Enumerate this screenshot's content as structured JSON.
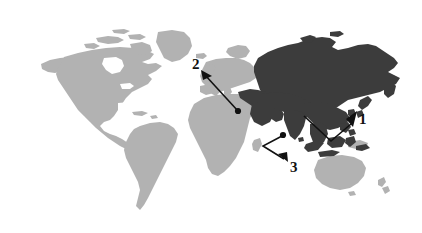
{
  "figure": {
    "type": "map-diagram",
    "title": "",
    "background_color": "#ffffff",
    "width": 422,
    "height": 233
  },
  "colors": {
    "background": "#ffffff",
    "highlighted_region": "#3c3c3c",
    "other_landmass": "#b2b2b2",
    "leader_line": "#111111",
    "label_text": "#111111"
  },
  "map": {
    "projection_note": "equirectangular world map",
    "highlighted_region_name": "Asia",
    "highlighted_fill": "#3c3c3c",
    "unhighlighted_fill": "#b2b2b2",
    "landmasses": [
      {
        "name": "north-america",
        "highlighted": false
      },
      {
        "name": "greenland",
        "highlighted": false
      },
      {
        "name": "south-america",
        "highlighted": false
      },
      {
        "name": "europe",
        "highlighted": false
      },
      {
        "name": "africa",
        "highlighted": false
      },
      {
        "name": "asia",
        "highlighted": true
      },
      {
        "name": "australia",
        "highlighted": false
      },
      {
        "name": "new-zealand",
        "highlighted": false
      }
    ]
  },
  "callouts": [
    {
      "id": "1",
      "label": "1",
      "label_x": 359,
      "label_y": 112,
      "arrow_tip_x": 351,
      "arrow_tip_y": 122,
      "target_region": "east-asia",
      "leader_points": "351,124 331,141 304,116"
    },
    {
      "id": "2",
      "label": "2",
      "label_x": 192,
      "label_y": 57,
      "arrow_tip_x": 203,
      "arrow_tip_y": 73,
      "target_region": "middle-east",
      "leader_points": "205,75 238,111"
    },
    {
      "id": "3",
      "label": "3",
      "label_x": 290,
      "label_y": 160,
      "arrow_tip_x": 284,
      "arrow_tip_y": 158,
      "target_region": "south-and-southeast-asia",
      "leader_points": "282,136 263,146 284,159"
    }
  ]
}
